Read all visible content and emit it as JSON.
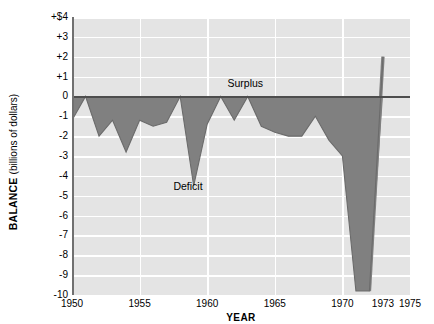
{
  "chart_data": {
    "type": "area",
    "title": "",
    "xlabel": "YEAR",
    "ylabel": "BALANCE",
    "ylabel_main": "BALANCE",
    "ylabel_sub": "(billions of dollars)",
    "xlim": [
      1950,
      1975
    ],
    "ylim": [
      -10,
      4
    ],
    "grid": true,
    "legend_position": "none",
    "x_tick_labels": [
      "1950",
      "1955",
      "1960",
      "1965",
      "1970",
      "1973",
      "1975"
    ],
    "x_tick_values": [
      1950,
      1955,
      1960,
      1965,
      1970,
      1973,
      1975
    ],
    "y_tick_labels": [
      "+$4",
      "+3",
      "+2",
      "+1",
      "0",
      "-1",
      "-2",
      "-3",
      "-4",
      "-5",
      "-6",
      "-7",
      "-8",
      "-9",
      "-10"
    ],
    "y_tick_values": [
      4,
      3,
      2,
      1,
      0,
      -1,
      -2,
      -3,
      -4,
      -5,
      -6,
      -7,
      -8,
      -9,
      -10
    ],
    "annotations": [
      {
        "name": "surplus-label",
        "text": "Surplus",
        "x": 1961.5,
        "y": 0.7
      },
      {
        "name": "deficit-label",
        "text": "Deficit",
        "x": 1957.5,
        "y": -4.5
      }
    ],
    "x": [
      1950,
      1951,
      1952,
      1953,
      1954,
      1955,
      1956,
      1957,
      1958,
      1959,
      1960,
      1961,
      1962,
      1963,
      1964,
      1965,
      1966,
      1967,
      1968,
      1969,
      1970,
      1971,
      1972,
      1973
    ],
    "values": [
      -1.2,
      0.0,
      -2.0,
      -1.2,
      -2.8,
      -1.2,
      -1.5,
      -1.3,
      0.0,
      -4.5,
      -1.4,
      0.0,
      -1.2,
      0.0,
      -1.5,
      -1.8,
      -2.0,
      -2.0,
      -1.0,
      -2.2,
      -3.0,
      -9.8,
      -9.8,
      2.0
    ],
    "series": [
      {
        "name": "Balance of payments",
        "values": [
          -1.2,
          0.0,
          -2.0,
          -1.2,
          -2.8,
          -1.2,
          -1.5,
          -1.3,
          0.0,
          -4.5,
          -1.4,
          0.0,
          -1.2,
          0.0,
          -1.5,
          -1.8,
          -2.0,
          -2.0,
          -1.0,
          -2.2,
          -3.0,
          -9.8,
          -9.8,
          2.0
        ],
        "fill_color": "#808080",
        "line_color": "#6b6b6b"
      }
    ]
  },
  "colors": {
    "plot_background": "#e4e4e4",
    "gridline": "#ffffff",
    "deficit_fill": "#808080",
    "zero_line": "#4d4d4d",
    "axis": "#707070",
    "text": "#000000"
  }
}
